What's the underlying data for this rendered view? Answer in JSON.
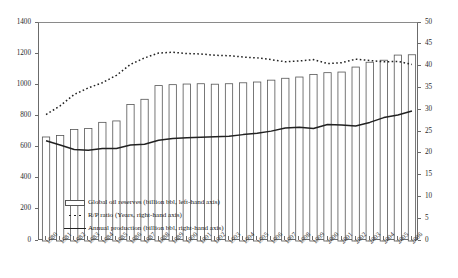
{
  "chart_data": {
    "type": "bar",
    "title": "",
    "subtitle": "",
    "xlabel": "",
    "ylabel": "",
    "y2label": "",
    "grid": false,
    "legend_position": "inside-bottom-left",
    "categories": [
      "1980",
      "1981",
      "1982",
      "1983",
      "1984",
      "1985",
      "1986",
      "1987",
      "1988",
      "1989",
      "1990",
      "1991",
      "1992",
      "1993",
      "1994",
      "1995",
      "1996",
      "1997",
      "1998",
      "1999",
      "2000",
      "2001",
      "2002",
      "2003",
      "2004",
      "2005",
      "2006"
    ],
    "ylim": [
      0,
      1400
    ],
    "ytick_labels": [
      "0",
      "200",
      "400",
      "600",
      "800",
      "1000",
      "1200",
      "1400"
    ],
    "ytick_values": [
      0,
      200,
      400,
      600,
      800,
      1000,
      1200,
      1400
    ],
    "y2lim": [
      0,
      50
    ],
    "y2tick_labels": [
      "0",
      "5",
      "10",
      "15",
      "20",
      "25",
      "30",
      "35",
      "40",
      "45",
      "50"
    ],
    "y2tick_values": [
      0,
      5,
      10,
      15,
      20,
      25,
      30,
      35,
      40,
      45,
      50
    ],
    "series": [
      {
        "name": "Global oil reserves (billion bbl, left-hand axis)",
        "type": "bar",
        "axis": "left",
        "values": [
          668,
          677,
          716,
          723,
          762,
          771,
          877,
          910,
          998,
          1004,
          1008,
          1010,
          1007,
          1010,
          1016,
          1021,
          1033,
          1045,
          1053,
          1070,
          1081,
          1085,
          1117,
          1148,
          1161,
          1194,
          1196
        ]
      },
      {
        "name": "R/P ratio (Years, right-hand axis)",
        "type": "line-dotted",
        "axis": "right",
        "values": [
          29.0,
          31.0,
          33.6,
          35.1,
          36.3,
          38.0,
          40.5,
          42.0,
          43.1,
          43.3,
          43.0,
          42.9,
          42.6,
          42.5,
          42.2,
          42.0,
          41.6,
          41.1,
          41.3,
          41.6,
          40.7,
          40.9,
          41.7,
          41.4,
          41.1,
          41.2,
          40.5
        ]
      },
      {
        "name": "Annual production (billion bbl, right-hand axis)",
        "type": "line-solid",
        "axis": "right",
        "values": [
          23.0,
          22.0,
          21.0,
          20.8,
          21.2,
          21.2,
          22.0,
          22.2,
          23.1,
          23.5,
          23.7,
          23.8,
          23.9,
          24.0,
          24.4,
          24.7,
          25.2,
          25.9,
          26.1,
          25.8,
          26.7,
          26.6,
          26.4,
          27.2,
          28.3,
          28.9,
          29.8
        ]
      }
    ]
  },
  "legend": {
    "items": [
      {
        "key": "bar-swatch",
        "label": "Global oil reserves (billion bbl, left-hand axis)"
      },
      {
        "key": "dotted-line-swatch",
        "label": "R/P ratio (Years, right-hand axis)"
      },
      {
        "key": "solid-line-swatch",
        "label": "Annual production (billion bbl, right-hand axis)"
      }
    ]
  },
  "colors": {
    "bar_fill": "#ffffff",
    "bar_stroke": "#555555",
    "dotted_line": "#222222",
    "solid_line": "#222222",
    "axis": "#6b6b6b",
    "text": "#1a1a1a",
    "background": "#ffffff"
  }
}
